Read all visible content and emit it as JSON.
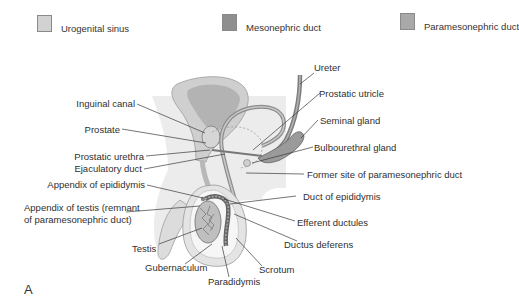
{
  "legend": {
    "items": [
      {
        "label": "Urogenital sinus",
        "color": "#d2d2d2"
      },
      {
        "label": "Mesonephric duct",
        "color": "#8f8f8f"
      },
      {
        "label": "Paramesonephric duct",
        "color": "#a9a9a9"
      }
    ]
  },
  "labels": {
    "inguinal_canal": "Inguinal canal",
    "prostate": "Prostate",
    "prostatic_urethra": "Prostatic urethra",
    "ejaculatory_duct": "Ejaculatory duct",
    "appendix_epididymis": "Appendix of epididymis",
    "appendix_testis_1": "Appendix of testis (remnant",
    "appendix_testis_2": "of paramesonephric duct)",
    "testis": "Testis",
    "gubernaculum": "Gubernaculum",
    "paradidymis": "Paradidymis",
    "scrotum": "Scrotum",
    "ductus_deferens": "Ductus deferens",
    "efferent_ductules": "Efferent ductules",
    "duct_epididymis": "Duct of epididymis",
    "former_site": "Former site of paramesonephric duct",
    "bulbourethral_gland": "Bulbourethral gland",
    "seminal_gland": "Seminal gland",
    "prostatic_utricle": "Prostatic utricle",
    "ureter": "Ureter"
  },
  "panel": {
    "letter": "A"
  }
}
